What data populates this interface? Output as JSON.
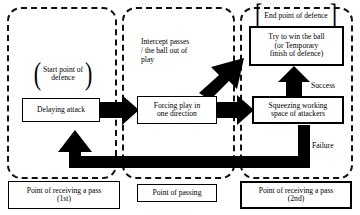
{
  "diagram": {
    "colors": {
      "ink": "#000000",
      "background": "#ffffff",
      "region_border": "#111111",
      "arrow_fill": "#000000"
    },
    "phases": [
      {
        "id": "phase-1",
        "label": "Point of receiving a pass",
        "sub": "(1st)"
      },
      {
        "id": "phase-2",
        "label": "Point of passing",
        "sub": ""
      },
      {
        "id": "phase-3",
        "label": "Point of receiving a pass",
        "sub": "(2nd)"
      }
    ],
    "phase_labels": [
      {
        "line1": "Point of receiving a pass",
        "line2": "(1st)"
      },
      {
        "line1": "Point of passing",
        "line2": ""
      },
      {
        "line1": "Point of receiving a pass",
        "line2": "(2nd)"
      }
    ],
    "markers": {
      "start": {
        "text_line1": "Start point of",
        "text_line2": "defence",
        "bracket_left": "(",
        "bracket_right": ")"
      },
      "end": {
        "text_line1": "End point of defence",
        "bracket_left": "[",
        "bracket_right": "]"
      }
    },
    "steps": [
      {
        "id": "delaying-attack",
        "line1": "Delaying attack",
        "line2": "",
        "line3": ""
      },
      {
        "id": "forcing-play",
        "line1": "Forcing play in",
        "line2": "one direction",
        "line3": ""
      },
      {
        "id": "squeezing-space",
        "line1": "Squeezing working",
        "line2": "space of attackers",
        "line3": ""
      },
      {
        "id": "try-win-ball",
        "line1": "Try to win the ball",
        "line2": "(or Temporary",
        "line3": "finish of defence)"
      }
    ],
    "annotations": {
      "intercept": {
        "line1": "Intercept passes",
        "line2": "/ the ball out of",
        "line3": "play"
      },
      "success": "Success",
      "failure": "Failure"
    },
    "arrows": [
      {
        "id": "delaying-to-forcing",
        "kind": "block-right"
      },
      {
        "id": "forcing-to-squeezing",
        "kind": "block-right"
      },
      {
        "id": "intercept-diagonal",
        "kind": "block-diagonal-up-right"
      },
      {
        "id": "success-up",
        "kind": "block-up"
      },
      {
        "id": "failure-loop",
        "kind": "block-loop-left"
      }
    ]
  }
}
